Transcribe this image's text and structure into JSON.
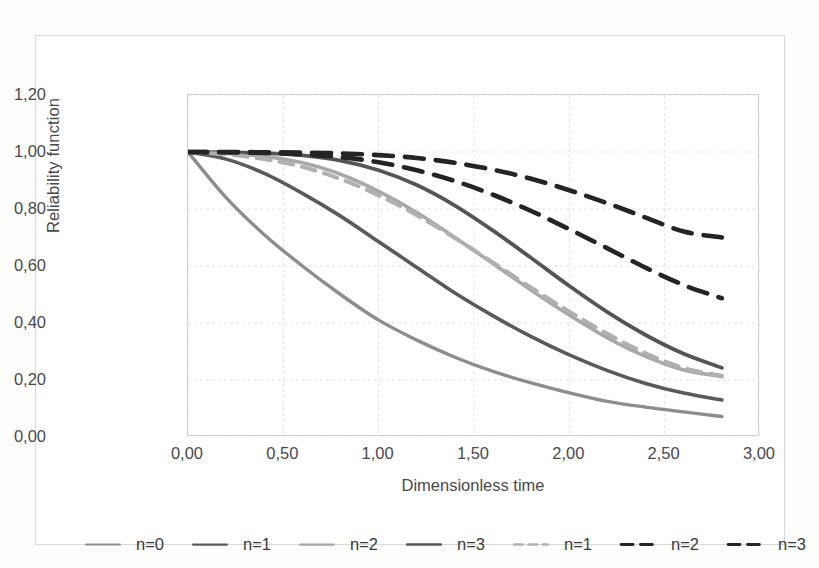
{
  "chart_data": {
    "type": "line",
    "title": "",
    "xlabel": "Dimensionless time",
    "ylabel": "Reliability function",
    "xlim": [
      0,
      3
    ],
    "ylim": [
      0,
      1.2
    ],
    "xticks": [
      "0,00",
      "0,50",
      "1,00",
      "1,50",
      "2,00",
      "2,50",
      "3,00"
    ],
    "xtick_values": [
      0,
      0.5,
      1.0,
      1.5,
      2.0,
      2.5,
      3.0
    ],
    "yticks": [
      "0,00",
      "0,20",
      "0,40",
      "0,60",
      "0,80",
      "1,00",
      "1,20"
    ],
    "ytick_values": [
      0,
      0.2,
      0.4,
      0.6,
      0.8,
      1.0,
      1.2
    ],
    "grid": true,
    "legend_position": "bottom",
    "x": [
      0,
      0.2,
      0.4,
      0.6,
      0.8,
      1.0,
      1.2,
      1.4,
      1.6,
      1.8,
      2.0,
      2.2,
      2.4,
      2.6,
      2.8
    ],
    "series": [
      {
        "name": "n=0",
        "label": "n=0",
        "style": "solid",
        "color": "#8d8d8d",
        "width": 3.4,
        "values": [
          1.0,
          0.84,
          0.71,
          0.6,
          0.5,
          0.41,
          0.34,
          0.28,
          0.23,
          0.19,
          0.155,
          0.125,
          0.105,
          0.088,
          0.072
        ]
      },
      {
        "name": "n=1",
        "label": "n=1",
        "style": "solid",
        "color": "#5a5a5a",
        "width": 3.6,
        "values": [
          1.0,
          0.975,
          0.925,
          0.855,
          0.775,
          0.685,
          0.595,
          0.505,
          0.425,
          0.352,
          0.288,
          0.233,
          0.188,
          0.154,
          0.13
        ]
      },
      {
        "name": "n=2",
        "label": "n=2",
        "style": "solid",
        "color": "#a8a8a8",
        "width": 3.6,
        "values": [
          1.0,
          0.995,
          0.985,
          0.962,
          0.922,
          0.862,
          0.788,
          0.7,
          0.608,
          0.515,
          0.428,
          0.348,
          0.283,
          0.235,
          0.212
        ]
      },
      {
        "name": "n=3",
        "label": "n=3",
        "style": "solid",
        "color": "#555555",
        "width": 3.8,
        "values": [
          1.0,
          0.999,
          0.996,
          0.988,
          0.97,
          0.936,
          0.884,
          0.812,
          0.724,
          0.628,
          0.53,
          0.438,
          0.358,
          0.292,
          0.243
        ]
      },
      {
        "name": "n=1-dashed",
        "label": "n=1",
        "style": "dashed",
        "color": "#b0b0b0",
        "width": 4.0,
        "dasharray": "14,9",
        "values": [
          1.0,
          0.992,
          0.975,
          0.948,
          0.905,
          0.848,
          0.778,
          0.698,
          0.612,
          0.524,
          0.44,
          0.362,
          0.294,
          0.242,
          0.215
        ]
      },
      {
        "name": "n=2-dashed",
        "label": "n=2",
        "style": "dashed",
        "color": "#242424",
        "width": 4.6,
        "dasharray": "19,12",
        "values": [
          1.0,
          0.999,
          0.997,
          0.992,
          0.982,
          0.964,
          0.936,
          0.898,
          0.85,
          0.793,
          0.729,
          0.662,
          0.594,
          0.533,
          0.487
        ]
      },
      {
        "name": "n=3-dashed",
        "label": "n=3",
        "style": "dashed",
        "color": "#242424",
        "width": 4.6,
        "dasharray": "19,12",
        "values": [
          1.0,
          1.0,
          0.999,
          0.998,
          0.995,
          0.989,
          0.979,
          0.962,
          0.938,
          0.906,
          0.866,
          0.82,
          0.77,
          0.721,
          0.7
        ]
      }
    ]
  },
  "legend": {
    "items": [
      {
        "label": "n=0",
        "series": 0
      },
      {
        "label": "n=1",
        "series": 1
      },
      {
        "label": "n=2",
        "series": 2
      },
      {
        "label": "n=3",
        "series": 3
      },
      {
        "label": "n=1",
        "series": 4
      },
      {
        "label": "n=2",
        "series": 5
      },
      {
        "label": "n=3",
        "series": 6
      }
    ]
  },
  "colors": {
    "background": "#ffffff",
    "frame_border": "#d8d8d6",
    "plot_border": "#cfcfcd",
    "gridline": "#e3e3e1",
    "text": "#4a4a4a"
  }
}
